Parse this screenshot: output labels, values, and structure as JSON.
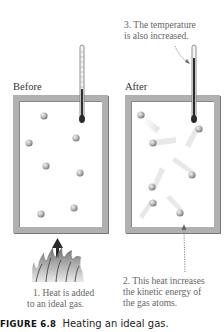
{
  "panels": [
    {
      "label": "Before",
      "state": "atoms at rest",
      "thermometer": "low reading"
    },
    {
      "label": "After",
      "state": "atoms moving rapidly",
      "thermometer": "high reading"
    }
  ],
  "annotations": {
    "note1_line1": "1. Heat is added",
    "note1_line2": "to an ideal gas.",
    "note2_line1": "2. This heat increases",
    "note2_line2": "the kinetic energy of",
    "note2_line3": "the gas atoms.",
    "note3_line1": "3. The temperature",
    "note3_line2": "is also increased."
  },
  "caption": {
    "figure_number": "FIGURE 6.8",
    "title": "Heating an ideal gas."
  },
  "colors": {
    "container_border": "#b0b0b0",
    "atom": "#a8a8a8",
    "thermometer_fluid": "#333333",
    "flame": "#999999"
  }
}
